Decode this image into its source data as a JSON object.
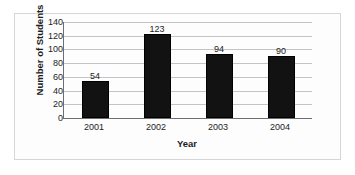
{
  "chart_data": {
    "type": "bar",
    "title": "",
    "categories": [
      "2001",
      "2002",
      "2003",
      "2004"
    ],
    "values": [
      54,
      123,
      94,
      90
    ],
    "data_labels": [
      "54",
      "123",
      "94",
      "90"
    ],
    "xlabel": "Year",
    "ylabel": "Number of Students",
    "ylim": [
      0,
      140
    ],
    "ytick_labels": [
      "140",
      "120",
      "100",
      "80",
      "60",
      "40",
      "20",
      "0"
    ],
    "ytick_values": [
      140,
      120,
      100,
      80,
      60,
      40,
      20,
      0
    ],
    "grid": "horizontal",
    "legend": "none",
    "bar_color": "#121212",
    "plot_background": "#fdfdfd",
    "gridline_color": "#c4c4c6",
    "axis_color": "#6e6e6e",
    "frame_border_color": "#d6d6d8"
  },
  "artifacts": {
    "cut_off_title_trace": ""
  }
}
